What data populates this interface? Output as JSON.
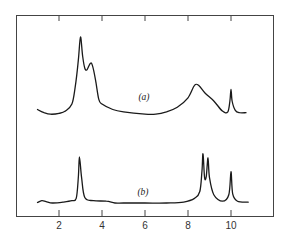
{
  "chart_data": {
    "type": "line",
    "title": "",
    "xlabel": "",
    "ylabel": "",
    "xlim": [
      0,
      12
    ],
    "x_ticks": [
      2,
      4,
      6,
      8,
      10
    ],
    "x_tick_labels": [
      "2",
      "4",
      "6",
      "8",
      "10"
    ],
    "grid": false,
    "legend": null,
    "y_units": "relative intensity (pixel-estimated, 0 = baseline, 100 = tallest peak)",
    "series": [
      {
        "name": "(a)",
        "label": "(a)",
        "label_position": {
          "x": 6.0,
          "y": 28
        },
        "points": [
          [
            1.0,
            7
          ],
          [
            1.3,
            3
          ],
          [
            1.6,
            1
          ],
          [
            2.0,
            2
          ],
          [
            2.3,
            5
          ],
          [
            2.6,
            14
          ],
          [
            2.75,
            35
          ],
          [
            2.9,
            70
          ],
          [
            3.0,
            100
          ],
          [
            3.1,
            75
          ],
          [
            3.2,
            60
          ],
          [
            3.3,
            58
          ],
          [
            3.45,
            66
          ],
          [
            3.55,
            64
          ],
          [
            3.7,
            45
          ],
          [
            3.85,
            20
          ],
          [
            4.0,
            14
          ],
          [
            4.5,
            7
          ],
          [
            5.0,
            4
          ],
          [
            6.0,
            1
          ],
          [
            6.5,
            1
          ],
          [
            7.0,
            4
          ],
          [
            7.5,
            10
          ],
          [
            8.0,
            22
          ],
          [
            8.3,
            38
          ],
          [
            8.5,
            38
          ],
          [
            8.8,
            28
          ],
          [
            9.2,
            18
          ],
          [
            9.6,
            5
          ],
          [
            9.85,
            4
          ],
          [
            9.95,
            18
          ],
          [
            10.0,
            33
          ],
          [
            10.05,
            18
          ],
          [
            10.2,
            6
          ],
          [
            10.4,
            3
          ],
          [
            10.7,
            3
          ]
        ]
      },
      {
        "name": "(b)",
        "label": "(b)",
        "label_position": {
          "x": 5.9,
          "y": 12
        },
        "points": [
          [
            1.0,
            1
          ],
          [
            1.2,
            5
          ],
          [
            1.4,
            3
          ],
          [
            1.7,
            0
          ],
          [
            2.2,
            2
          ],
          [
            2.6,
            5
          ],
          [
            2.8,
            10
          ],
          [
            2.9,
            55
          ],
          [
            2.95,
            100
          ],
          [
            3.05,
            55
          ],
          [
            3.2,
            12
          ],
          [
            3.6,
            5
          ],
          [
            4.2,
            4
          ],
          [
            4.6,
            0
          ],
          [
            5.0,
            0
          ],
          [
            6.0,
            0
          ],
          [
            7.0,
            0
          ],
          [
            7.8,
            2
          ],
          [
            8.3,
            10
          ],
          [
            8.55,
            25
          ],
          [
            8.65,
            70
          ],
          [
            8.7,
            107
          ],
          [
            8.77,
            55
          ],
          [
            8.85,
            58
          ],
          [
            8.93,
            98
          ],
          [
            9.0,
            55
          ],
          [
            9.2,
            18
          ],
          [
            9.6,
            4
          ],
          [
            9.9,
            18
          ],
          [
            10.0,
            68
          ],
          [
            10.08,
            20
          ],
          [
            10.3,
            4
          ],
          [
            10.8,
            2
          ]
        ]
      }
    ]
  },
  "annotations": {
    "label_a": "(a)",
    "label_b": "(b)"
  }
}
